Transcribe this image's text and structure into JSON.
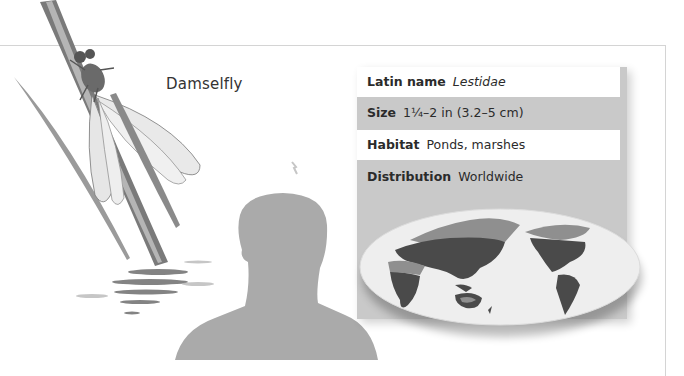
{
  "title": "Damselfly",
  "facts": [
    {
      "key": "Latin name",
      "value": "Lestidae",
      "italic": true
    },
    {
      "key": "Size",
      "value": "1¼–2 in (3.2–5 cm)",
      "italic": false
    },
    {
      "key": "Habitat",
      "value": "Ponds, marshes",
      "italic": false
    },
    {
      "key": "Distribution",
      "value": "Worldwide",
      "italic": false
    }
  ],
  "map": {
    "label": "distribution-map",
    "colors": {
      "ocean": "#eeeeee",
      "present": "#4a4a4a",
      "absent": "#8f8f8f"
    }
  },
  "colors": {
    "panel": "#c9c9c9",
    "silhouette": "#aaaaaa",
    "frame": "#d4d4d4"
  }
}
